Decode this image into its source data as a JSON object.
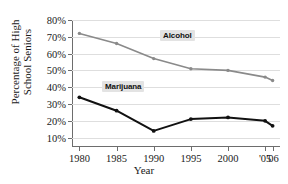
{
  "chart_data": {
    "type": "line",
    "title": "",
    "title_fragment": "",
    "xlabel": "Year",
    "ylabel_line1": "Percentage of High",
    "ylabel_line2": "School Seniors",
    "categories": [
      "1980",
      "1985",
      "1990",
      "1995",
      "2000",
      "'05",
      "'06"
    ],
    "x": [
      1980,
      1985,
      1990,
      1995,
      2000,
      2005,
      2006
    ],
    "xlim": [
      1979,
      2007
    ],
    "ylim": [
      5,
      80
    ],
    "yticks": [
      10,
      20,
      30,
      40,
      50,
      60,
      70,
      80
    ],
    "ytick_labels": [
      "10%",
      "20%",
      "30%",
      "40%",
      "50%",
      "60%",
      "70%",
      "80%"
    ],
    "grid": true,
    "legend_position": "inline-callout",
    "series": [
      {
        "name": "Alcohol",
        "color": "#8a8a8a",
        "values": [
          72,
          66,
          57,
          51,
          50,
          46,
          44
        ]
      },
      {
        "name": "Marijuana",
        "color": "#111111",
        "values": [
          34,
          26,
          14,
          21,
          22,
          20,
          17
        ]
      }
    ],
    "annotations": [
      {
        "text": "Alcohol",
        "series": "Alcohol"
      },
      {
        "text": "Marijuana",
        "series": "Marijuana"
      }
    ]
  }
}
